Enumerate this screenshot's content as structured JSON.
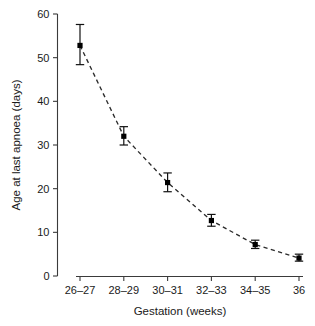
{
  "chart_data": {
    "type": "scatter",
    "title": "",
    "xlabel": "Gestation (weeks)",
    "ylabel": "Age at last apnoea (days)",
    "categories": [
      "26–27",
      "28–29",
      "30–31",
      "32–33",
      "34–35",
      "36"
    ],
    "values": [
      52.8,
      32.0,
      21.4,
      12.7,
      7.2,
      4.1
    ],
    "error_low": [
      48.4,
      30.0,
      19.3,
      11.4,
      6.3,
      3.4
    ],
    "error_high": [
      57.6,
      34.2,
      23.6,
      14.1,
      8.2,
      5.0
    ],
    "ylim": [
      0,
      60
    ],
    "yticks": [
      0,
      10,
      20,
      30,
      40,
      50,
      60
    ],
    "ytick_labels": [
      "0",
      "10",
      "20",
      "30",
      "40",
      "50",
      "60"
    ],
    "xtick_labels": [
      "26–27",
      "28–29",
      "30–31",
      "32–33",
      "34–35",
      "36"
    ],
    "grid": false,
    "legend": "none",
    "line_style": "dashed",
    "marker_style": "filled-square",
    "colors": {
      "line": "#2b2b2b",
      "marker": "#000000",
      "axis": "#3a3a3a",
      "text": "#1a1a1a",
      "background": "#ffffff"
    }
  },
  "axes": {
    "y_title": "Age at last apnoea (days)",
    "x_title": "Gestation (weeks)"
  }
}
